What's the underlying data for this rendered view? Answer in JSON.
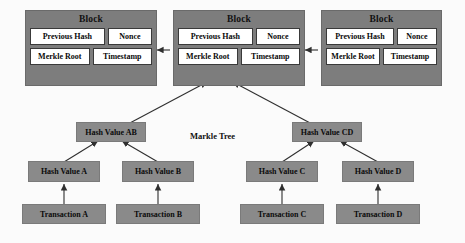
{
  "diagram": {
    "title_label": "Markle Tree",
    "colors": {
      "block_fill": "#7d7d7d",
      "node_fill": "#8a8a8a",
      "cell_fill": "#ffffff",
      "line": "#3a3a3a",
      "background": "#fbfbfb"
    }
  },
  "blocks": [
    {
      "header": "Block",
      "previous_hash": "Previous Hash",
      "nonce": "Nonce",
      "merkle_root": "Merkle Root",
      "timestamp": "Timestamp"
    },
    {
      "header": "Block",
      "previous_hash": "Previous Hash",
      "nonce": "Nonce",
      "merkle_root": "Merkle Root",
      "timestamp": "Timestamp"
    },
    {
      "header": "Block",
      "previous_hash": "Previous Hash",
      "nonce": "Nonce",
      "merkle_root": "Merkle Root",
      "timestamp": "Timestamp"
    }
  ],
  "tree": {
    "internal_nodes": [
      {
        "label": "Hash Value AB"
      },
      {
        "label": "Hash Value CD"
      }
    ],
    "hash_leaves": [
      {
        "label": "Hash Value A"
      },
      {
        "label": "Hash Value B"
      },
      {
        "label": "Hash Value C"
      },
      {
        "label": "Hash Value D"
      }
    ],
    "transactions": [
      {
        "label": "Transaction A"
      },
      {
        "label": "Transaction B"
      },
      {
        "label": "Transaction C"
      },
      {
        "label": "Transaction D"
      }
    ]
  }
}
